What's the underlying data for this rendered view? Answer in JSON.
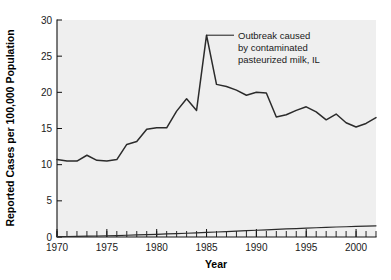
{
  "chart_data": {
    "type": "line",
    "title": "",
    "xlabel": "Year",
    "ylabel": "Reported Cases per 100,000 Population",
    "xlim": [
      1970,
      2002
    ],
    "ylim": [
      0,
      30
    ],
    "grid": false,
    "legend": "none",
    "x_ticks_major": [
      1970,
      1975,
      1980,
      1985,
      1990,
      1995,
      2000
    ],
    "x_tick_labels": [
      "1970",
      "1975",
      "1980",
      "1985",
      "1990",
      "1995",
      "2000"
    ],
    "x_ticks_minor_step": 1,
    "y_ticks": [
      0,
      5,
      10,
      15,
      20,
      25,
      30
    ],
    "y_tick_labels": [
      "0",
      "5",
      "10",
      "15",
      "20",
      "25",
      "30"
    ],
    "x": [
      1970,
      1971,
      1972,
      1973,
      1974,
      1975,
      1976,
      1977,
      1978,
      1979,
      1980,
      1981,
      1982,
      1983,
      1984,
      1985,
      1986,
      1987,
      1988,
      1989,
      1990,
      1991,
      1992,
      1993,
      1994,
      1995,
      1996,
      1997,
      1998,
      1999,
      2000,
      2001,
      2002
    ],
    "series": [
      {
        "name": "Reported cases per 100,000 population",
        "values": [
          10.7,
          10.5,
          10.5,
          11.3,
          10.6,
          10.5,
          10.7,
          12.8,
          13.2,
          14.9,
          15.1,
          15.1,
          17.4,
          19.1,
          17.5,
          27.9,
          21.1,
          20.8,
          20.3,
          19.6,
          20.0,
          19.9,
          16.6,
          16.9,
          17.5,
          18.0,
          17.3,
          16.2,
          17.0,
          15.8,
          15.2,
          15.7,
          16.5
        ]
      },
      {
        "name": "Secondary baseline series",
        "values": [
          0.05,
          0.07,
          0.09,
          0.11,
          0.14,
          0.17,
          0.2,
          0.24,
          0.28,
          0.32,
          0.37,
          0.42,
          0.47,
          0.52,
          0.58,
          0.63,
          0.69,
          0.75,
          0.81,
          0.87,
          0.93,
          0.99,
          1.05,
          1.11,
          1.17,
          1.23,
          1.28,
          1.33,
          1.38,
          1.42,
          1.46,
          1.5,
          1.54
        ]
      }
    ],
    "annotations": [
      {
        "name": "outbreak-annotation",
        "lines": [
          "Outbreak caused",
          "by contaminated",
          "pasteurized milk, IL"
        ],
        "points_to_x": 1985,
        "points_to_y": 27.9
      }
    ],
    "colors": {
      "plot_background": "#efefef",
      "figure_background": "#ffffff",
      "line": "#2b2b2b",
      "axis": "#111111",
      "text": "#1a1a1a"
    }
  }
}
